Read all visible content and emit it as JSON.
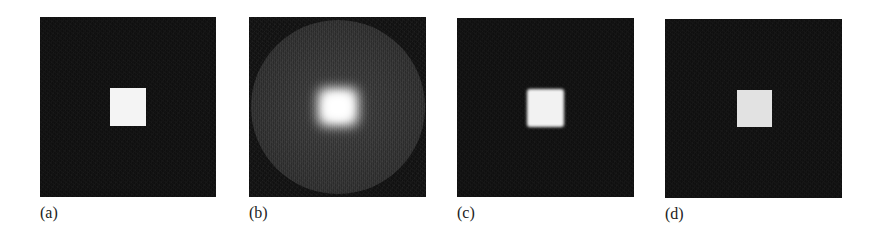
{
  "figure": {
    "panels": [
      {
        "label": "(a)",
        "description": "Original: bright square on dark noisy background",
        "bg_color": "#121212",
        "square_color": "#f4f4f4"
      },
      {
        "label": "(b)",
        "description": "Blurred bright center within a faint circular disk",
        "bg_color": "#141414",
        "disk_color": "#3a3a3a",
        "center_color": "#ffffff"
      },
      {
        "label": "(c)",
        "description": "Restored square with soft edges",
        "bg_color": "#121212",
        "square_color": "#f2f2f2"
      },
      {
        "label": "(d)",
        "description": "Restored square with sharp edges, light gray",
        "bg_color": "#121212",
        "square_color": "#e2e2e2"
      }
    ]
  }
}
